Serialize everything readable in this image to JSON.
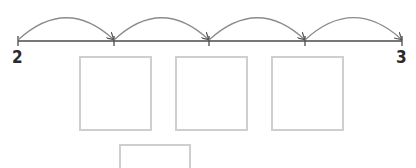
{
  "number_line": {
    "start_label": "2",
    "end_label": "3",
    "ticks": 5,
    "jumps": 4,
    "line_color": "#4a4a4a",
    "arc_color": "#8a8a8a"
  },
  "answer_boxes": {
    "row1_count": 3,
    "row2_count": 1,
    "border_color": "#cfcfcf"
  }
}
